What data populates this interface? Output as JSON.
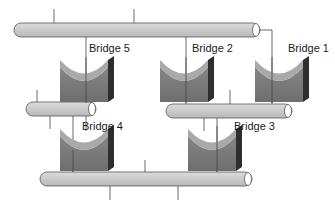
{
  "diagram": {
    "type": "network-topology",
    "colors": {
      "bus_fill": "#c9c9c9",
      "bus_stroke": "#555555",
      "bridge_top": "#a8a8a8",
      "bridge_front": "#7a7a7a",
      "bridge_side": "#2e2e2e",
      "line": "#444444"
    },
    "segments": [
      {
        "id": "segment-top",
        "x1": 14,
        "x2": 258,
        "y": 30
      },
      {
        "id": "segment-middle-left",
        "x1": 26,
        "x2": 96,
        "y": 109
      },
      {
        "id": "segment-middle-right",
        "x1": 166,
        "x2": 292,
        "y": 111
      },
      {
        "id": "segment-bottom",
        "x1": 40,
        "x2": 252,
        "y": 179
      }
    ],
    "bridges": [
      {
        "label": "Bridge 5",
        "x": 60,
        "y": 58,
        "label_x": 89,
        "label_y": 42
      },
      {
        "label": "Bridge 2",
        "x": 160,
        "y": 58,
        "label_x": 192,
        "label_y": 42
      },
      {
        "label": "Bridge 1",
        "x": 255,
        "y": 58,
        "label_x": 288,
        "label_y": 42
      },
      {
        "label": "Bridge 4",
        "x": 60,
        "y": 128,
        "label_x": 82,
        "label_y": 122
      },
      {
        "label": "Bridge 3",
        "x": 188,
        "y": 128,
        "label_x": 234,
        "label_y": 122
      }
    ]
  }
}
